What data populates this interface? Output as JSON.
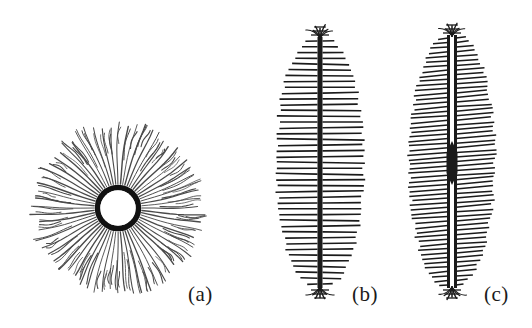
{
  "figure": {
    "background_color": "#ffffff",
    "ink_color": "#1a1a1a",
    "fiber_color": "#4a4a4a",
    "width": 532,
    "height": 328
  },
  "panels": [
    {
      "id": "a",
      "label": "(a)",
      "morphology": "spherulite",
      "description": "Radial spherulite: thick black central ring nucleus with fine branching fibrils radiating outward in all directions",
      "center_x": 118,
      "center_y": 208,
      "outer_radius": 88,
      "nucleus_outer_radius": 23,
      "nucleus_inner_radius": 18,
      "nucleus_stroke": 5,
      "fibril_count": 64,
      "fibril_color": "#4a4a4a",
      "fibril_width": 1.1,
      "branching": true
    },
    {
      "id": "b",
      "label": "(b)",
      "morphology": "shish-kebab single backbone",
      "description": "Shish-kebab: single thick black central backbone with horizontal lamellar kebabs forming a lens-shaped envelope; splayed fibrillar tips at both ends",
      "axis_x": 320,
      "top_y": 35,
      "bottom_y": 290,
      "half_width": 44,
      "spine_width": 5,
      "spine_split": false,
      "center_node": false,
      "lamella_count": 42,
      "lamella_width": 1.6,
      "tip_splay": true
    },
    {
      "id": "c",
      "label": "(c)",
      "morphology": "shish-kebab split backbone with central node",
      "description": "Shish-kebab with a split (double) backbone separated by a narrow gap and a dense black node at mid-height; denser, slightly tilted lamellae filling a lens-shaped envelope; splayed tips at both ends",
      "axis_x": 452,
      "top_y": 33,
      "bottom_y": 290,
      "half_width": 43,
      "spine_width": 3,
      "spine_gap": 4,
      "spine_split": true,
      "center_node": true,
      "node_y": 163,
      "node_width": 11,
      "node_height": 20,
      "lamella_count": 54,
      "lamella_width": 1.5,
      "lamella_tilt_deg": 4,
      "tip_splay": true
    }
  ]
}
